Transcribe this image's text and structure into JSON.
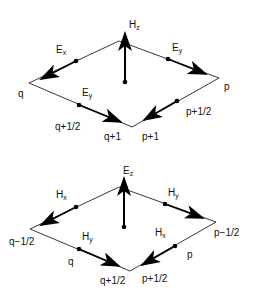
{
  "diagrams": [
    {
      "name": "H-field cell",
      "center": {
        "label": "H",
        "sub": "z"
      },
      "arrows": [
        {
          "label": "E",
          "sub": "x",
          "edge": "top-left"
        },
        {
          "label": "E",
          "sub": "y",
          "edge": "top-right"
        },
        {
          "label": "E",
          "sub": "y",
          "edge": "bottom-left"
        },
        {
          "label": "",
          "sub": "",
          "edge": "bottom-right"
        }
      ],
      "node_labels": {
        "left": "q",
        "right": "p",
        "bottom_left_mid": "q+1/2",
        "bottom": "q+1",
        "bottom_right": "p+1",
        "right_mid": "p+1/2"
      }
    },
    {
      "name": "E-field cell",
      "center": {
        "label": "E",
        "sub": "z"
      },
      "arrows": [
        {
          "label": "H",
          "sub": "x",
          "edge": "top-left"
        },
        {
          "label": "H",
          "sub": "y",
          "edge": "top-right"
        },
        {
          "label": "H",
          "sub": "y",
          "edge": "bottom-left"
        },
        {
          "label": "H",
          "sub": "x",
          "edge": "bottom-right"
        }
      ],
      "node_labels": {
        "left": "q−1/2",
        "right": "p−1/2",
        "bottom_left_mid": "q",
        "bottom": "q+1/2",
        "bottom_right": "p+1/2",
        "right_mid": "p"
      }
    }
  ]
}
